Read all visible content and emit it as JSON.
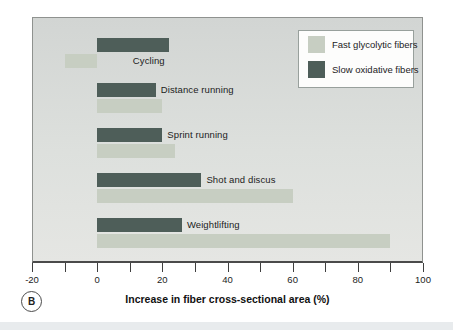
{
  "figure": {
    "panel_label": "B",
    "x_axis_title": "Increase in fiber cross-sectional area (%)"
  },
  "legend": {
    "items": [
      {
        "label": "Fast glycolytic fibers",
        "color": "#c7cec2"
      },
      {
        "label": "Slow oxidative fibers",
        "color": "#4e5e59"
      }
    ]
  },
  "chart_data": {
    "type": "bar",
    "orientation": "horizontal",
    "title": "",
    "xlabel": "Increase in fiber cross-sectional area (%)",
    "ylabel": "",
    "xlim": [
      -20,
      100
    ],
    "x_major_ticks": [
      -20,
      0,
      20,
      40,
      60,
      80,
      100
    ],
    "x_major_tick_labels": [
      "-20",
      "0",
      "20",
      "40",
      "60",
      "80",
      "100"
    ],
    "x_minor_ticks": [
      -10,
      10,
      30,
      50,
      70,
      90
    ],
    "grid": false,
    "legend_position": "top-right inside plot",
    "categories": [
      "Cycling",
      "Distance running",
      "Sprint running",
      "Shot and discus",
      "Weightlifting"
    ],
    "series": [
      {
        "name": "Slow oxidative fibers",
        "color": "#4e5e59",
        "values": [
          22,
          18,
          20,
          32,
          26
        ]
      },
      {
        "name": "Fast glycolytic fibers",
        "color": "#c7cec2",
        "values": [
          -10,
          20,
          24,
          60,
          90
        ]
      }
    ]
  },
  "colors": {
    "plot_background": "#d9dcd9",
    "plot_border": "#8f928f",
    "axis": "#3f3f3f",
    "page_background": "#ffffff",
    "bottom_strip": "#e8ebed",
    "text": "#1c1c1c"
  }
}
